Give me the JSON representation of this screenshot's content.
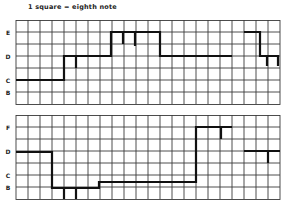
{
  "caption": "1 square = eighth note",
  "panels": [
    {
      "labels": [
        {
          "text": "E",
          "row": 1
        },
        {
          "text": "D",
          "row": 3
        },
        {
          "text": "C",
          "row": 5
        },
        {
          "text": "B",
          "row": 6
        }
      ]
    },
    {
      "labels": [
        {
          "text": "F",
          "row": 1
        },
        {
          "text": "D",
          "row": 3
        },
        {
          "text": "C",
          "row": 5
        },
        {
          "text": "B",
          "row": 6
        }
      ]
    }
  ],
  "grid": {
    "columns": 22,
    "rows": 7,
    "cell_px": 12,
    "line_color": "#2a2a2a",
    "melody_color": "#111111"
  }
}
